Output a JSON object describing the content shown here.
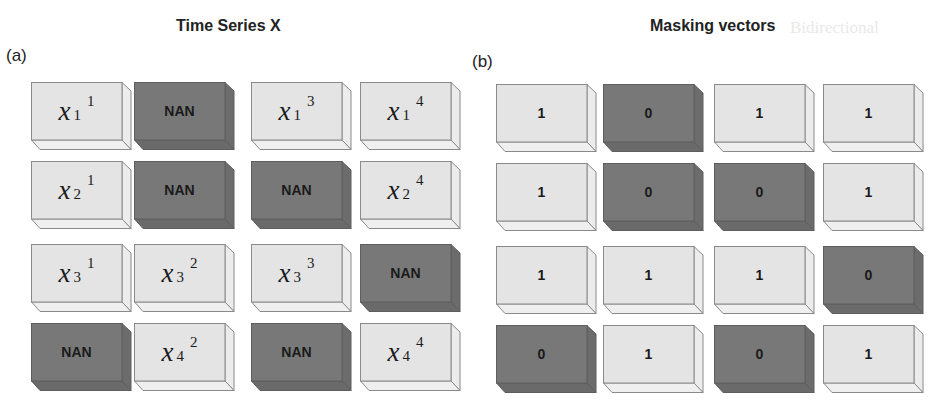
{
  "panels": [
    {
      "id": "a",
      "label": "(a)",
      "title": "Time Series X",
      "cells": [
        [
          {
            "type": "value",
            "base": "x",
            "sub": "1",
            "sup": "1"
          },
          {
            "type": "nan",
            "text": "NAN"
          },
          {
            "type": "value",
            "base": "x",
            "sub": "1",
            "sup": "3"
          },
          {
            "type": "value",
            "base": "x",
            "sub": "1",
            "sup": "4"
          }
        ],
        [
          {
            "type": "value",
            "base": "x",
            "sub": "2",
            "sup": "1"
          },
          {
            "type": "nan",
            "text": "NAN"
          },
          {
            "type": "nan",
            "text": "NAN"
          },
          {
            "type": "value",
            "base": "x",
            "sub": "2",
            "sup": "4"
          }
        ],
        [
          {
            "type": "value",
            "base": "x",
            "sub": "3",
            "sup": "1"
          },
          {
            "type": "value",
            "base": "x",
            "sub": "3",
            "sup": "2"
          },
          {
            "type": "value",
            "base": "x",
            "sub": "3",
            "sup": "3"
          },
          {
            "type": "nan",
            "text": "NAN"
          }
        ],
        [
          {
            "type": "nan",
            "text": "NAN"
          },
          {
            "type": "value",
            "base": "x",
            "sub": "4",
            "sup": "2"
          },
          {
            "type": "nan",
            "text": "NAN"
          },
          {
            "type": "value",
            "base": "x",
            "sub": "4",
            "sup": "4"
          }
        ]
      ]
    },
    {
      "id": "b",
      "label": "(b)",
      "title": "Masking vectors",
      "cells": [
        [
          {
            "type": "one",
            "text": "1"
          },
          {
            "type": "zero",
            "text": "0"
          },
          {
            "type": "one",
            "text": "1"
          },
          {
            "type": "one",
            "text": "1"
          }
        ],
        [
          {
            "type": "one",
            "text": "1"
          },
          {
            "type": "zero",
            "text": "0"
          },
          {
            "type": "zero",
            "text": "0"
          },
          {
            "type": "one",
            "text": "1"
          }
        ],
        [
          {
            "type": "one",
            "text": "1"
          },
          {
            "type": "one",
            "text": "1"
          },
          {
            "type": "one",
            "text": "1"
          },
          {
            "type": "zero",
            "text": "0"
          }
        ],
        [
          {
            "type": "zero",
            "text": "0"
          },
          {
            "type": "one",
            "text": "1"
          },
          {
            "type": "zero",
            "text": "0"
          },
          {
            "type": "one",
            "text": "1"
          }
        ]
      ]
    }
  ],
  "background_ghost_text": "Bidirectional",
  "colors": {
    "observed_face": "#e4e4e4",
    "observed_edge": "#8a8a8a",
    "missing_face": "#787878",
    "missing_edge": "#5e5e5e",
    "text": "#1a1a1a"
  }
}
